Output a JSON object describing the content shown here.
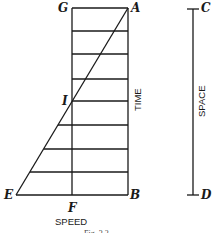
{
  "figure": {
    "caption": "Fig. 3.2",
    "colors": {
      "ink": "#1a1a1a",
      "background": "#ffffff"
    }
  },
  "points": {
    "G": "G",
    "A": "A",
    "I": "I",
    "E": "E",
    "F": "F",
    "B": "B",
    "C": "C",
    "D": "D"
  },
  "axes": {
    "time": "TIME",
    "space": "SPACE",
    "speed": "SPEED"
  },
  "geometry": {
    "rectangle": {
      "left_x": 72,
      "right_x": 128,
      "top_y": 8,
      "bottom_y": 195
    },
    "horizontal_lines_y": [
      8,
      31,
      54,
      79,
      101,
      125,
      149,
      172,
      195
    ],
    "diagonal": {
      "from": "E",
      "to": "A",
      "passes_through": "I"
    },
    "space_line": {
      "x": 193,
      "top_y": 9,
      "bottom_y": 195
    }
  }
}
